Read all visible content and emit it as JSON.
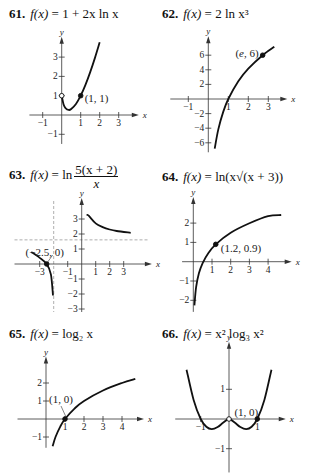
{
  "problems": [
    {
      "number": "61.",
      "lhs": "f(x)",
      "eq": "=",
      "rhs": "1 + 2x ln x",
      "point_label": "(1, 1)"
    },
    {
      "number": "62.",
      "lhs": "f(x)",
      "eq": "=",
      "rhs": "2 ln x³",
      "point_label": "(e, 6)"
    },
    {
      "number": "63.",
      "lhs": "f(x)",
      "eq": "=",
      "rhs_prefix": "ln",
      "numerator": "5(x + 2)",
      "denominator": "x",
      "point_label": "(−2.5, 0)"
    },
    {
      "number": "64.",
      "lhs": "f(x)",
      "eq": "=",
      "rhs": "ln(x√(x + 3))",
      "point_label": "(1.2, 0.9)"
    },
    {
      "number": "65.",
      "lhs": "f(x)",
      "eq": "=",
      "rhs": "log₂ x",
      "point_label": "(1, 0)"
    },
    {
      "number": "66.",
      "lhs": "f(x)",
      "eq": "=",
      "rhs": "x² log₃ x²",
      "point_label": "(1, 0)"
    }
  ],
  "chart_data": [
    {
      "id": "61",
      "type": "line",
      "title": "f(x) = 1 + 2x ln x",
      "xlabel": "x",
      "ylabel": "y",
      "xticks": [
        -1,
        1,
        2,
        3
      ],
      "yticks": [
        -1,
        1,
        2,
        3
      ],
      "xlim": [
        -1.5,
        3.8
      ],
      "ylim": [
        -1.5,
        3.8
      ],
      "series": [
        {
          "name": "f",
          "x": [
            0,
            0.1,
            0.2,
            0.37,
            0.5,
            0.75,
            1,
            1.25,
            1.5,
            1.75,
            2
          ],
          "y": [
            1,
            0.54,
            0.36,
            0.26,
            0.31,
            0.57,
            1,
            1.56,
            2.22,
            2.96,
            3.77
          ]
        }
      ],
      "points": [
        {
          "x": 1,
          "y": 1,
          "label": "(1, 1)",
          "filled": true
        },
        {
          "x": 0,
          "y": 1,
          "filled": false
        }
      ]
    },
    {
      "id": "62",
      "type": "line",
      "title": "f(x) = 2 ln x^3",
      "xlabel": "x",
      "ylabel": "y",
      "xticks": [
        -1,
        1,
        2,
        3
      ],
      "yticks": [
        -6,
        -4,
        -2,
        2,
        4,
        6
      ],
      "xlim": [
        -1.5,
        3.8
      ],
      "ylim": [
        -7,
        8
      ],
      "series": [
        {
          "name": "f",
          "x": [
            0.32,
            0.5,
            0.75,
            1,
            1.5,
            2,
            2.718,
            3.3
          ],
          "y": [
            -6.8,
            -4.16,
            -1.73,
            0,
            2.43,
            4.16,
            6,
            7.16
          ]
        }
      ],
      "points": [
        {
          "x": 2.718,
          "y": 6,
          "label": "(e, 6)",
          "filled": true
        }
      ]
    },
    {
      "id": "63",
      "type": "line",
      "title": "f(x) = ln(5(x + 2)/x)",
      "xlabel": "x",
      "ylabel": "y",
      "xticks": [
        -3,
        -1,
        1,
        2,
        3
      ],
      "yticks": [
        -3,
        -2,
        -1,
        1,
        2,
        3
      ],
      "xlim": [
        -3.8,
        3.8
      ],
      "ylim": [
        -3.3,
        4
      ],
      "asymptotes": {
        "vertical": -2,
        "horizontal": 1.609
      },
      "series": [
        {
          "name": "left",
          "x": [
            -3.6,
            -3,
            -2.5,
            -2.2,
            -2.05
          ],
          "y": [
            0.8,
            0.41,
            0,
            -0.69,
            -2.1
          ]
        },
        {
          "name": "right",
          "x": [
            0.35,
            0.5,
            1,
            1.5,
            2,
            2.5,
            3.5
          ],
          "y": [
            3.3,
            3.22,
            2.71,
            2.46,
            2.3,
            2.2,
            2.08
          ]
        }
      ],
      "points": [
        {
          "x": -2.5,
          "y": 0,
          "label": "(−2.5, 0)",
          "filled": true
        }
      ]
    },
    {
      "id": "64",
      "type": "line",
      "title": "f(x) = ln(x√(x + 3))",
      "xlabel": "x",
      "ylabel": "y",
      "xticks": [
        1,
        2,
        3,
        4
      ],
      "yticks": [
        -2,
        -1,
        1,
        2
      ],
      "xlim": [
        -0.3,
        4.8
      ],
      "ylim": [
        -2.5,
        3
      ],
      "series": [
        {
          "name": "f",
          "x": [
            0.06,
            0.15,
            0.3,
            0.5,
            0.8,
            1.2,
            2,
            3,
            4,
            4.7
          ],
          "y": [
            -2.26,
            -1.32,
            -0.6,
            -0.07,
            0.44,
            0.9,
            1.5,
            1.99,
            2.36,
            2.42
          ]
        }
      ],
      "points": [
        {
          "x": 1.2,
          "y": 0.9,
          "label": "(1.2, 0.9)",
          "filled": true
        }
      ]
    },
    {
      "id": "65",
      "type": "line",
      "title": "f(x) = log_2 x",
      "xlabel": "x",
      "ylabel": "y",
      "xticks": [
        1,
        2,
        3,
        4
      ],
      "yticks": [
        -1,
        1,
        2
      ],
      "xlim": [
        -0.3,
        4.8
      ],
      "ylim": [
        -1.6,
        2.6
      ],
      "series": [
        {
          "name": "f",
          "x": [
            0.35,
            0.5,
            0.75,
            1,
            1.5,
            2,
            3,
            4,
            4.7
          ],
          "y": [
            -1.51,
            -1,
            -0.42,
            0,
            0.58,
            1,
            1.58,
            2,
            2.23
          ]
        }
      ],
      "points": [
        {
          "x": 1,
          "y": 0,
          "label": "(1, 0)",
          "filled": true
        }
      ]
    },
    {
      "id": "66",
      "type": "line",
      "title": "f(x) = x^2 log_3 x^2",
      "xlabel": "x",
      "ylabel": "y",
      "xticks": [
        -1,
        1
      ],
      "yticks": [
        -1,
        1
      ],
      "xlim": [
        -1.8,
        1.8
      ],
      "ylim": [
        -1.8,
        1.9
      ],
      "series": [
        {
          "name": "f",
          "x": [
            -1.5,
            -1.25,
            -1,
            -0.8,
            -0.61,
            -0.4,
            -0.2,
            0,
            0.2,
            0.4,
            0.61,
            0.8,
            1,
            1.25,
            1.5
          ],
          "y": [
            1.66,
            0.64,
            0,
            -0.26,
            -0.34,
            -0.27,
            -0.12,
            0,
            -0.12,
            -0.27,
            -0.34,
            -0.26,
            0,
            0.64,
            1.66
          ]
        }
      ],
      "points": [
        {
          "x": 1,
          "y": 0,
          "label": "(1, 0)",
          "filled": true
        },
        {
          "x": 0,
          "y": 0,
          "filled": false
        }
      ]
    }
  ]
}
